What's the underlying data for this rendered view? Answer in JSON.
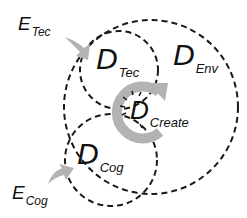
{
  "diagram": {
    "colors": {
      "stroke": "#1a1a1a",
      "arrow": "#b3b3b3",
      "background": "#ffffff"
    },
    "regions": [
      {
        "id": "env",
        "main": "D",
        "sub": "Env"
      },
      {
        "id": "tec",
        "main": "D",
        "sub": "Tec"
      },
      {
        "id": "cog",
        "main": "D",
        "sub": "Cog"
      },
      {
        "id": "create",
        "main": "D",
        "sub": "Create"
      }
    ],
    "inputs": [
      {
        "id": "e_tec",
        "main": "E",
        "sub": "Tec"
      },
      {
        "id": "e_cog",
        "main": "E",
        "sub": "Cog"
      }
    ]
  }
}
